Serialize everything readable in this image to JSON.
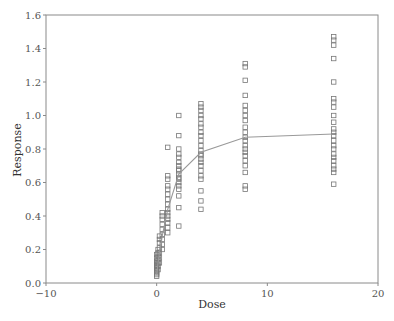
{
  "chart_data": {
    "type": "scatter",
    "title": "",
    "xlabel": "Dose",
    "ylabel": "Response",
    "xlim": [
      -10,
      20
    ],
    "ylim": [
      0.0,
      1.6
    ],
    "xticks": [
      -10,
      0,
      10,
      20
    ],
    "xtick_labels": [
      "−10",
      "0",
      "10",
      "20"
    ],
    "yticks": [
      0.0,
      0.2,
      0.4,
      0.6,
      0.8,
      1.0,
      1.2,
      1.4,
      1.6
    ],
    "ytick_labels": [
      "0.0",
      "0.2",
      "0.4",
      "0.6",
      "0.8",
      "1.0",
      "1.2",
      "1.4",
      "1.6"
    ],
    "grid": false,
    "legend": null,
    "series": [
      {
        "name": "observed",
        "kind": "scatter",
        "marker": "open-square",
        "color": "#777777",
        "points": [
          [
            0,
            0.04
          ],
          [
            0,
            0.05
          ],
          [
            0,
            0.06
          ],
          [
            0,
            0.07
          ],
          [
            0,
            0.08
          ],
          [
            0,
            0.09
          ],
          [
            0,
            0.1
          ],
          [
            0,
            0.11
          ],
          [
            0,
            0.12
          ],
          [
            0,
            0.13
          ],
          [
            0,
            0.15
          ],
          [
            0,
            0.17
          ],
          [
            0.125,
            0.08
          ],
          [
            0.125,
            0.1
          ],
          [
            0.125,
            0.12
          ],
          [
            0.125,
            0.14
          ],
          [
            0.125,
            0.16
          ],
          [
            0.125,
            0.18
          ],
          [
            0.125,
            0.2
          ],
          [
            0.25,
            0.12
          ],
          [
            0.25,
            0.15
          ],
          [
            0.25,
            0.18
          ],
          [
            0.25,
            0.21
          ],
          [
            0.25,
            0.24
          ],
          [
            0.25,
            0.26
          ],
          [
            0.25,
            0.28
          ],
          [
            0.5,
            0.2
          ],
          [
            0.5,
            0.23
          ],
          [
            0.5,
            0.26
          ],
          [
            0.5,
            0.29
          ],
          [
            0.5,
            0.32
          ],
          [
            0.5,
            0.35
          ],
          [
            0.5,
            0.38
          ],
          [
            0.5,
            0.4
          ],
          [
            0.5,
            0.42
          ],
          [
            1,
            0.3
          ],
          [
            1,
            0.33
          ],
          [
            1,
            0.36
          ],
          [
            1,
            0.38
          ],
          [
            1,
            0.4
          ],
          [
            1,
            0.42
          ],
          [
            1,
            0.44
          ],
          [
            1,
            0.47
          ],
          [
            1,
            0.5
          ],
          [
            1,
            0.53
          ],
          [
            1,
            0.56
          ],
          [
            1,
            0.58
          ],
          [
            1,
            0.62
          ],
          [
            1,
            0.64
          ],
          [
            1,
            0.81
          ],
          [
            2,
            0.34
          ],
          [
            2,
            0.45
          ],
          [
            2,
            0.52
          ],
          [
            2,
            0.56
          ],
          [
            2,
            0.58
          ],
          [
            2,
            0.6
          ],
          [
            2,
            0.62
          ],
          [
            2,
            0.63
          ],
          [
            2,
            0.65
          ],
          [
            2,
            0.67
          ],
          [
            2,
            0.68
          ],
          [
            2,
            0.7
          ],
          [
            2,
            0.72
          ],
          [
            2,
            0.75
          ],
          [
            2,
            0.77
          ],
          [
            2,
            0.8
          ],
          [
            2,
            0.88
          ],
          [
            2,
            1.0
          ],
          [
            4,
            0.44
          ],
          [
            4,
            0.49
          ],
          [
            4,
            0.55
          ],
          [
            4,
            0.62
          ],
          [
            4,
            0.64
          ],
          [
            4,
            0.67
          ],
          [
            4,
            0.7
          ],
          [
            4,
            0.72
          ],
          [
            4,
            0.74
          ],
          [
            4,
            0.76
          ],
          [
            4,
            0.77
          ],
          [
            4,
            0.79
          ],
          [
            4,
            0.82
          ],
          [
            4,
            0.85
          ],
          [
            4,
            0.88
          ],
          [
            4,
            0.9
          ],
          [
            4,
            0.93
          ],
          [
            4,
            0.95
          ],
          [
            4,
            0.98
          ],
          [
            4,
            1.0
          ],
          [
            4,
            1.03
          ],
          [
            4,
            1.05
          ],
          [
            4,
            1.07
          ],
          [
            8,
            0.56
          ],
          [
            8,
            0.58
          ],
          [
            8,
            0.66
          ],
          [
            8,
            0.7
          ],
          [
            8,
            0.73
          ],
          [
            8,
            0.76
          ],
          [
            8,
            0.78
          ],
          [
            8,
            0.8
          ],
          [
            8,
            0.82
          ],
          [
            8,
            0.85
          ],
          [
            8,
            0.87
          ],
          [
            8,
            0.9
          ],
          [
            8,
            0.93
          ],
          [
            8,
            0.97
          ],
          [
            8,
            1.0
          ],
          [
            8,
            1.03
          ],
          [
            8,
            1.06
          ],
          [
            8,
            1.12
          ],
          [
            8,
            1.21
          ],
          [
            8,
            1.29
          ],
          [
            8,
            1.31
          ],
          [
            16,
            0.59
          ],
          [
            16,
            0.66
          ],
          [
            16,
            0.68
          ],
          [
            16,
            0.7
          ],
          [
            16,
            0.73
          ],
          [
            16,
            0.75
          ],
          [
            16,
            0.77
          ],
          [
            16,
            0.8
          ],
          [
            16,
            0.82
          ],
          [
            16,
            0.85
          ],
          [
            16,
            0.88
          ],
          [
            16,
            0.9
          ],
          [
            16,
            0.92
          ],
          [
            16,
            0.96
          ],
          [
            16,
            1.0
          ],
          [
            16,
            1.05
          ],
          [
            16,
            1.08
          ],
          [
            16,
            1.1
          ],
          [
            16,
            1.2
          ],
          [
            16,
            1.34
          ],
          [
            16,
            1.42
          ],
          [
            16,
            1.45
          ],
          [
            16,
            1.47
          ]
        ]
      },
      {
        "name": "fitted",
        "kind": "line",
        "color": "#999999",
        "points": [
          [
            0,
            0.05
          ],
          [
            0.125,
            0.12
          ],
          [
            0.25,
            0.18
          ],
          [
            0.5,
            0.28
          ],
          [
            1,
            0.44
          ],
          [
            2,
            0.65
          ],
          [
            4,
            0.78
          ],
          [
            8,
            0.87
          ],
          [
            16,
            0.89
          ]
        ]
      }
    ]
  }
}
